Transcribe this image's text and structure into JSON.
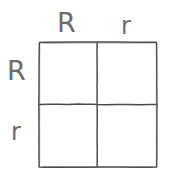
{
  "figure": {
    "type": "punnett-square",
    "title": "",
    "grid_size": "2x2",
    "ink_color": "#4a4a4a",
    "text_color": "#6b6b6b",
    "background_color": "#ffffff"
  },
  "top_axis": {
    "name": "paternal-gametes",
    "alleles": [
      {
        "label": "R",
        "case": "dominant"
      },
      {
        "label": "r",
        "case": "recessive"
      }
    ]
  },
  "left_axis": {
    "name": "maternal-gametes",
    "alleles": [
      {
        "label": "R",
        "case": "dominant"
      },
      {
        "label": "r",
        "case": "recessive"
      }
    ]
  },
  "cells": [
    {
      "row": 0,
      "col": 0,
      "genotype": ""
    },
    {
      "row": 0,
      "col": 1,
      "genotype": ""
    },
    {
      "row": 1,
      "col": 0,
      "genotype": ""
    },
    {
      "row": 1,
      "col": 1,
      "genotype": ""
    }
  ]
}
